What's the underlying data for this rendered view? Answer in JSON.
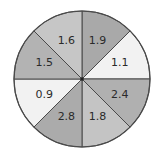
{
  "spinner": {
    "center": [
      82,
      79
    ],
    "radius": 68,
    "outline_color": "#4a4a4a",
    "sectors": [
      {
        "label": "1.9",
        "start_deg": 0,
        "end_deg": 45,
        "fill": "#a9a9a9"
      },
      {
        "label": "1.1",
        "start_deg": 45,
        "end_deg": 90,
        "fill": "#f2f2f2"
      },
      {
        "label": "2.4",
        "start_deg": 90,
        "end_deg": 135,
        "fill": "#b0b0b0"
      },
      {
        "label": "1.8",
        "start_deg": 135,
        "end_deg": 180,
        "fill": "#c4c4c4"
      },
      {
        "label": "2.8",
        "start_deg": 180,
        "end_deg": 225,
        "fill": "#ababab"
      },
      {
        "label": "0.9",
        "start_deg": 225,
        "end_deg": 270,
        "fill": "#f2f2f2"
      },
      {
        "label": "1.5",
        "start_deg": 270,
        "end_deg": 315,
        "fill": "#b3b3b3"
      },
      {
        "label": "1.6",
        "start_deg": 315,
        "end_deg": 360,
        "fill": "#c6c6c6"
      }
    ]
  }
}
